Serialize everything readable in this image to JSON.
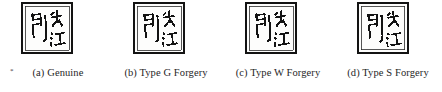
{
  "figure": {
    "name": "seal-impression-comparison-figure",
    "background_color": "#ffffff",
    "ink_color": "#141414",
    "footnote_mark": "*",
    "seal_text": {
      "full": "印长江",
      "characters": [
        {
          "glyph": "印",
          "romanization": "yin",
          "position": "left"
        },
        {
          "glyph": "长",
          "romanization": "chang",
          "position": "top-right"
        },
        {
          "glyph": "江",
          "romanization": "jiang",
          "position": "bottom-right"
        }
      ]
    },
    "panels": [
      {
        "id": "a",
        "caption": "(a) Genuine",
        "label": "(a)",
        "type": "Genuine",
        "seal_alt": "Seal impression reading 印长江"
      },
      {
        "id": "b",
        "caption": "(b) Type G Forgery",
        "label": "(b)",
        "type": "Type G Forgery",
        "seal_alt": "Seal impression reading 印长江"
      },
      {
        "id": "c",
        "caption": "(c) Type W Forgery",
        "label": "(c)",
        "type": "Type W Forgery",
        "seal_alt": "Seal impression reading 印长江"
      },
      {
        "id": "d",
        "caption": "(d) Type S Forgery",
        "label": "(d)",
        "type": "Type S Forgery",
        "seal_alt": "Seal impression reading 印长江"
      }
    ]
  }
}
